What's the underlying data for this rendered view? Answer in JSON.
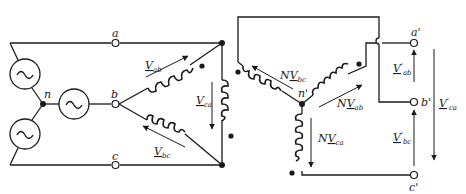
{
  "diagram": {
    "source_side": {
      "node_labels": {
        "a": "a",
        "b": "b",
        "c": "c",
        "n": "n"
      },
      "sources": [
        {
          "name": "source-a",
          "symbol": "~"
        },
        {
          "name": "source-b",
          "symbol": "~"
        },
        {
          "name": "source-c",
          "symbol": "~"
        }
      ],
      "voltages": {
        "ab": {
          "base": "V",
          "sub": "ab"
        },
        "bc": {
          "base": "V",
          "sub": "bc"
        },
        "ca": {
          "base": "V",
          "sub": "ca"
        }
      }
    },
    "secondary_side": {
      "node_labels": {
        "n": "n'",
        "a": "a'",
        "b": "b'",
        "c": "c'"
      },
      "winding_voltages": {
        "bc": {
          "prefix": "N",
          "base": "V",
          "sub": "bc"
        },
        "ab": {
          "prefix": "N",
          "base": "V",
          "sub": "ab"
        },
        "ca": {
          "prefix": "N",
          "base": "V",
          "sub": "ca"
        }
      },
      "output_voltages": {
        "ab": {
          "base": "V",
          "prime": "'",
          "sub": "ab"
        },
        "bc": {
          "base": "V",
          "prime": "'",
          "sub": "bc"
        },
        "ca": {
          "base": "V",
          "prime": "'",
          "sub": "ca"
        }
      }
    },
    "colors": {
      "ink": "#1a1a1a",
      "background": "#ffffff"
    }
  }
}
